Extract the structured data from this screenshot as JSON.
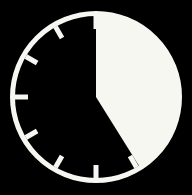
{
  "canvas": {
    "width": 192,
    "height": 195,
    "background_color": "#000000"
  },
  "icon": {
    "name": "clock-timer-icon",
    "title": "Clock timer",
    "style": "monochrome silhouette",
    "foreground_color": "#f7f7f2",
    "background_color": "#000000"
  },
  "clock": {
    "center_x": 96,
    "center_y": 97,
    "outer_radius": 86,
    "ring_thickness": 5,
    "ring_color": "#f7f7f2",
    "face_color": "#000000",
    "tick_count": 12,
    "tick_length": 13,
    "tick_thickness": 5,
    "tick_color": "#f7f7f2",
    "tick_angles_deg": [
      0,
      30,
      60,
      90,
      120,
      150,
      180,
      210,
      240,
      270,
      300,
      330
    ],
    "tick_labels": [
      "12",
      "1",
      "2",
      "3",
      "4",
      "5",
      "6",
      "7",
      "8",
      "9",
      "10",
      "11"
    ]
  },
  "wedge": {
    "name": "elapsed-time-wedge",
    "fill_color": "#f7f7f2",
    "start_angle_deg": 0,
    "end_angle_deg": 148,
    "sweep_deg": 148,
    "direction": "clockwise",
    "radius": 82,
    "elapsed_minutes": 25,
    "elapsed_fraction": 0.411,
    "start_label": "12:00",
    "end_label": "25 min"
  }
}
